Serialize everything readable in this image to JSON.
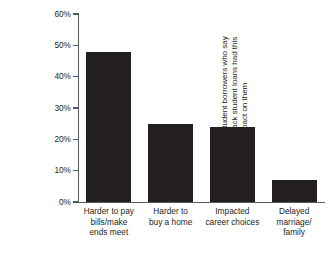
{
  "chart_data": {
    "type": "bar",
    "title": "",
    "xlabel": "",
    "ylabel": "Percentage of student borrowers who say having to pay back student loans had this impact on them",
    "ylabel_lines": [
      "Percentage of student borrowers who say",
      "having to pay back student loans had this",
      "impact on them"
    ],
    "categories": [
      "Harder to pay bills/make ends meet",
      "Harder to buy a home",
      "Impacted career choices",
      "Delayed marriage/family"
    ],
    "category_lines": [
      [
        "Harder to pay",
        "bills/make",
        "ends meet"
      ],
      [
        "Harder to",
        "buy a home"
      ],
      [
        "Impacted",
        "career choices"
      ],
      [
        "Delayed",
        "marriage/",
        "family"
      ]
    ],
    "values": [
      48,
      25,
      24,
      7
    ],
    "value_labels": [
      "48%",
      "25%",
      "24%",
      "7%"
    ],
    "ylim": [
      0,
      60
    ],
    "yticks": [
      0,
      10,
      20,
      30,
      40,
      50,
      60
    ],
    "ytick_labels": [
      "0%",
      "10%",
      "20%",
      "30%",
      "40%",
      "50%",
      "60%"
    ],
    "grid": false,
    "legend": false,
    "legend_position": "none",
    "bar_color": "#231f20",
    "axis_color": "#58595b",
    "background_color": "#ffffff"
  }
}
